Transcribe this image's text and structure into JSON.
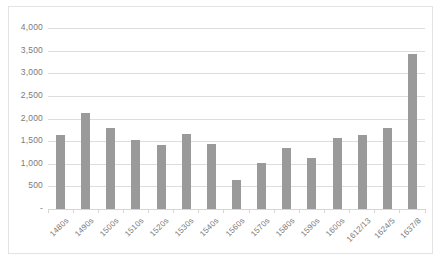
{
  "chart_data": {
    "type": "bar",
    "title": "",
    "subtitle": "",
    "xlabel": "",
    "ylabel": "",
    "ylim": [
      0,
      4000
    ],
    "grid": true,
    "legend": "none",
    "orientation": "vertical",
    "bar_color": "#9a9a9a",
    "gridline_color": "#dddddd",
    "axis_text_color": "#7a7a7a",
    "plot_background": "#ffffff",
    "border_color": "#e3e3e3",
    "ytick_labels": [
      "4,000",
      "3,500",
      "3,000",
      "2,500",
      "2,000",
      "1,500",
      "1,000",
      "500",
      "-"
    ],
    "ytick_values": [
      4000,
      3500,
      3000,
      2500,
      2000,
      1500,
      1000,
      500,
      0
    ],
    "categories": [
      "1480s",
      "1490s",
      "1500s",
      "1510s",
      "1520s",
      "1530s",
      "1540s",
      "1560s",
      "1570s",
      "1580s",
      "1590s",
      "1600s",
      "1612/13",
      "1624/5",
      "1637/8"
    ],
    "values": [
      1630,
      2130,
      1800,
      1520,
      1420,
      1660,
      1430,
      640,
      1020,
      1350,
      1120,
      1560,
      1630,
      1800,
      3420
    ]
  }
}
